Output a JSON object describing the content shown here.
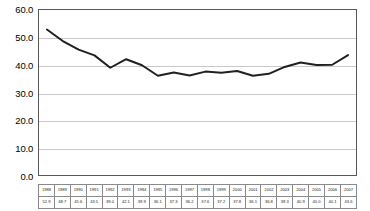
{
  "chart_data": {
    "type": "line",
    "title": "",
    "xlabel": "",
    "ylabel": "",
    "categories": [
      "1988",
      "1989",
      "1990",
      "1991",
      "1992",
      "1993",
      "1994",
      "1995",
      "1996",
      "1997",
      "1998",
      "1999",
      "2000",
      "2001",
      "2002",
      "2003",
      "2004",
      "2005",
      "2006",
      "2007"
    ],
    "values": [
      52.9,
      48.7,
      45.6,
      43.5,
      39.0,
      42.1,
      39.9,
      36.1,
      37.3,
      36.2,
      37.6,
      37.2,
      37.8,
      36.1,
      36.8,
      39.3,
      40.9,
      40.0,
      40.1,
      43.6
    ],
    "value_labels": [
      "52.9",
      "48.7",
      "45.6",
      "43.5",
      "39.0",
      "42.1",
      "39.9",
      "36.1",
      "37.3",
      "36.2",
      "37.6",
      "37.2",
      "37.8",
      "36.1",
      "36.8",
      "39.3",
      "40.9",
      "40.0",
      "40.1",
      "43.6"
    ],
    "ylim": [
      0.0,
      60.0
    ],
    "ytick_labels": [
      "0.0",
      "10.0",
      "20.0",
      "30.0",
      "40.0",
      "50.0",
      "60.0"
    ],
    "ytick_values": [
      0.0,
      10.0,
      20.0,
      30.0,
      40.0,
      50.0,
      60.0
    ],
    "grid": true,
    "legend": "none",
    "series_color": "#231f20",
    "grid_color": "#c9c9cb",
    "axis_color": "#58585a"
  }
}
